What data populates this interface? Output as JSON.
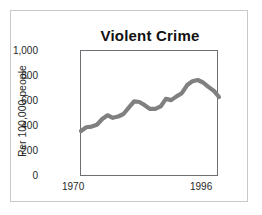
{
  "figure": {
    "title": "Violent Crime",
    "frame_color": "#c9c9c9",
    "axis_color": "#6e6e74",
    "line_color": "#808080",
    "background": "#ffffff"
  },
  "chart_data": {
    "type": "line",
    "title": "Violent Crime",
    "xlabel": "",
    "ylabel": "Per 100,000 people",
    "xlim": [
      1970,
      1996
    ],
    "ylim": [
      0,
      1000
    ],
    "grid": false,
    "legend": null,
    "yticks": [
      0,
      200,
      400,
      600,
      800,
      1000
    ],
    "ytick_labels": [
      "0",
      "200",
      "400",
      "600",
      "800",
      "1,000"
    ],
    "xticks": [
      1970,
      1996
    ],
    "xtick_labels": [
      "1970",
      "1996"
    ],
    "x": [
      1970,
      1971,
      1972,
      1973,
      1974,
      1975,
      1976,
      1977,
      1978,
      1979,
      1980,
      1981,
      1982,
      1983,
      1984,
      1985,
      1986,
      1987,
      1988,
      1989,
      1990,
      1991,
      1992,
      1993,
      1994,
      1995,
      1996
    ],
    "values": [
      365,
      395,
      400,
      415,
      460,
      490,
      470,
      480,
      500,
      550,
      600,
      595,
      570,
      540,
      540,
      560,
      620,
      610,
      640,
      665,
      730,
      760,
      770,
      750,
      715,
      685,
      635
    ],
    "series": [
      {
        "name": "Violent crime rate",
        "values": [
          365,
          395,
          400,
          415,
          460,
          490,
          470,
          480,
          500,
          550,
          600,
          595,
          570,
          540,
          540,
          560,
          620,
          610,
          640,
          665,
          730,
          760,
          770,
          750,
          715,
          685,
          635
        ]
      }
    ]
  }
}
